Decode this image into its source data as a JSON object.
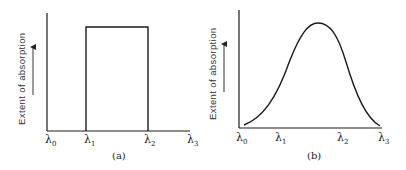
{
  "panels": [
    {
      "id": "a",
      "caption": "(a)",
      "ylabel": "Extent of absorption",
      "x_ticks": [
        {
          "sym": "λ",
          "sub": "0"
        },
        {
          "sym": "λ",
          "sub": "1"
        },
        {
          "sym": "λ",
          "sub": "2"
        },
        {
          "sym": "λ",
          "sub": "3"
        }
      ],
      "shape": "rectangular absorption band between λ1 and λ2"
    },
    {
      "id": "b",
      "caption": "(b)",
      "ylabel": "Extent of absorption",
      "x_ticks": [
        {
          "sym": "λ",
          "sub": "0"
        },
        {
          "sym": "λ",
          "sub": "1"
        },
        {
          "sym": "λ",
          "sub": "2"
        },
        {
          "sym": "λ",
          "sub": "3"
        }
      ],
      "shape": "bell-shaped absorption curve from λ0 to λ3 peaking between λ1 and λ2"
    }
  ],
  "colors": {
    "line": "#1a1a1a",
    "text": "#222222",
    "background": "#ffffff"
  }
}
